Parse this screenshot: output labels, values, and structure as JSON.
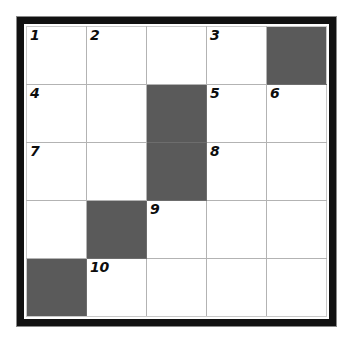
{
  "puzzle": {
    "type": "crossword-grid",
    "rows": 5,
    "columns": 5,
    "blocked_color": "#5a5a5a",
    "cell_color": "#ffffff",
    "gridline_color": "#b3b3b3",
    "frame_color": "#111111",
    "background_color": "#ffffff",
    "highest_clue_number": 10,
    "grid": [
      [
        {
          "number": "1",
          "blocked": false
        },
        {
          "number": "2",
          "blocked": false
        },
        {
          "number": "",
          "blocked": false
        },
        {
          "number": "3",
          "blocked": false
        },
        {
          "number": "",
          "blocked": true
        }
      ],
      [
        {
          "number": "4",
          "blocked": false
        },
        {
          "number": "",
          "blocked": false
        },
        {
          "number": "",
          "blocked": true
        },
        {
          "number": "5",
          "blocked": false
        },
        {
          "number": "6",
          "blocked": false
        }
      ],
      [
        {
          "number": "7",
          "blocked": false
        },
        {
          "number": "",
          "blocked": false
        },
        {
          "number": "",
          "blocked": true
        },
        {
          "number": "8",
          "blocked": false
        },
        {
          "number": "",
          "blocked": false
        }
      ],
      [
        {
          "number": "",
          "blocked": false
        },
        {
          "number": "",
          "blocked": true
        },
        {
          "number": "9",
          "blocked": false
        },
        {
          "number": "",
          "blocked": false
        },
        {
          "number": "",
          "blocked": false
        }
      ],
      [
        {
          "number": "",
          "blocked": true
        },
        {
          "number": "10",
          "blocked": false
        },
        {
          "number": "",
          "blocked": false
        },
        {
          "number": "",
          "blocked": false
        },
        {
          "number": "",
          "blocked": false
        }
      ]
    ]
  }
}
